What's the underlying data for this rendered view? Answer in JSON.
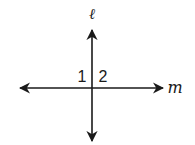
{
  "diagram": {
    "stroke_color": "#1a1a1a",
    "background": "#ffffff",
    "lines": [
      {
        "name": "l",
        "label": "ℓ",
        "orientation": "vertical",
        "x": 92,
        "y1": 28,
        "y2": 143,
        "arrows": "both"
      },
      {
        "name": "m",
        "label": "m",
        "orientation": "horizontal",
        "y": 88,
        "x1": 18,
        "x2": 165,
        "arrows": "both"
      }
    ],
    "labels": {
      "line_l": "ℓ",
      "line_m": "m",
      "angle_1": "1",
      "angle_2": "2"
    }
  }
}
